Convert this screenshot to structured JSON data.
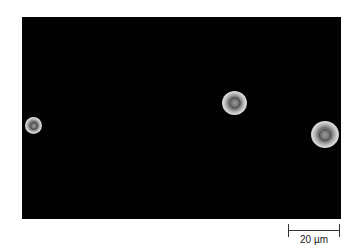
{
  "image": {
    "type": "micrograph",
    "background_color": "#020202",
    "cells": [
      {
        "label": "cell-left",
        "cx": 12,
        "cy": 109,
        "diameter": 17
      },
      {
        "label": "cell-center",
        "cx": 212,
        "cy": 86,
        "diameter": 24
      },
      {
        "label": "cell-right",
        "cx": 302,
        "cy": 117,
        "diameter": 27
      }
    ]
  },
  "scale_bar": {
    "label": "20 µm",
    "length_px": 52
  }
}
